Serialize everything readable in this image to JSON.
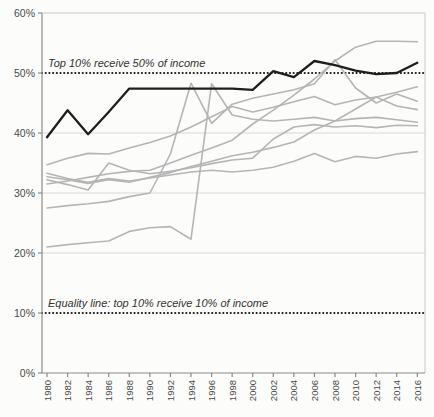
{
  "chart_data": {
    "type": "line",
    "title": "",
    "xlabel": "",
    "ylabel": "",
    "xlim": [
      1980,
      2016
    ],
    "ylim": [
      0,
      60
    ],
    "legend": "none",
    "grid": "horizontal-only",
    "categories": [
      1980,
      1982,
      1984,
      1986,
      1988,
      1990,
      1992,
      1994,
      1996,
      1998,
      2000,
      2002,
      2004,
      2006,
      2008,
      2010,
      2012,
      2014,
      2016
    ],
    "x_tick_labels": [
      "1980",
      "1982",
      "1984",
      "1986",
      "1988",
      "1990",
      "1992",
      "1994",
      "1996",
      "1998",
      "2000",
      "2002",
      "2004",
      "2006",
      "2008",
      "2010",
      "2012",
      "2014",
      "2016"
    ],
    "y_tick_labels": [
      "0%",
      "10%",
      "20%",
      "30%",
      "40%",
      "50%",
      "60%"
    ],
    "y_tick_values": [
      0,
      10,
      20,
      30,
      40,
      50,
      60
    ],
    "reference_lines": [
      {
        "value": 50,
        "label": "Top 10% receive 50% of income",
        "style": "dotted"
      },
      {
        "value": 10,
        "label": "Equality line: top 10% receive 10% of income",
        "style": "dotted"
      }
    ],
    "colors": {
      "highlighted": "#1f1f1f",
      "background_series": "#b5b5b5",
      "gridline": "#d8d8d6",
      "frame": "#c9c9c7",
      "axis": "#8a8a88",
      "reference_dots": "#1a1a1a",
      "tick_text": "#4a4a4a",
      "annotation_text": "#333333",
      "page_background": "#fcfcfb"
    },
    "series": [
      {
        "id": "gray-1",
        "role": "background",
        "values": [
          34.7,
          35.8,
          36.6,
          36.5,
          37.5,
          38.4,
          39.5,
          41.0,
          42.7,
          44.4,
          43.5,
          44.3,
          45.2,
          46.1,
          44.7,
          45.5,
          46.0,
          46.8,
          47.7
        ]
      },
      {
        "id": "gray-2",
        "role": "background",
        "values": [
          31.5,
          32.0,
          32.6,
          33.2,
          33.6,
          33.8,
          35.0,
          36.3,
          37.5,
          38.8,
          41.5,
          43.8,
          46.3,
          49.0,
          52.0,
          54.3,
          55.3,
          55.3,
          55.2
        ]
      },
      {
        "id": "gray-3",
        "role": "background",
        "values": [
          27.5,
          27.9,
          28.2,
          28.6,
          29.4,
          30.0,
          36.5,
          48.3,
          41.6,
          44.8,
          45.8,
          46.5,
          47.2,
          48.2,
          52.2,
          47.5,
          45.0,
          46.5,
          45.3
        ]
      },
      {
        "id": "gray-4",
        "role": "background",
        "values": [
          21.0,
          21.4,
          21.7,
          22.0,
          23.6,
          24.2,
          24.4,
          22.3,
          48.2,
          43.0,
          42.3,
          42.0,
          42.3,
          42.6,
          42.0,
          42.4,
          42.6,
          42.2,
          41.8
        ]
      },
      {
        "id": "gray-5",
        "role": "background",
        "values": [
          32.2,
          31.4,
          30.5,
          35.0,
          33.8,
          33.2,
          33.6,
          34.2,
          34.9,
          35.5,
          35.8,
          39.0,
          41.0,
          41.4,
          41.0,
          41.2,
          40.9,
          41.3,
          41.2
        ]
      },
      {
        "id": "gray-6",
        "role": "background",
        "values": [
          32.7,
          32.2,
          31.6,
          32.2,
          31.8,
          32.6,
          33.4,
          34.4,
          35.3,
          36.2,
          36.8,
          37.6,
          38.5,
          40.5,
          42.0,
          44.0,
          46.0,
          44.5,
          43.9
        ]
      },
      {
        "id": "gray-7",
        "role": "background",
        "values": [
          33.3,
          32.4,
          31.8,
          32.4,
          32.0,
          32.5,
          33.0,
          33.5,
          33.8,
          33.5,
          33.8,
          34.3,
          35.3,
          36.6,
          35.2,
          36.1,
          35.8,
          36.5,
          36.9
        ]
      },
      {
        "id": "highlighted-country",
        "role": "highlighted",
        "values": [
          39.3,
          43.8,
          39.8,
          43.5,
          47.4,
          47.4,
          47.4,
          47.4,
          47.4,
          47.4,
          47.2,
          50.3,
          49.3,
          52.0,
          51.3,
          50.4,
          49.8,
          50.0,
          51.7
        ]
      }
    ]
  }
}
